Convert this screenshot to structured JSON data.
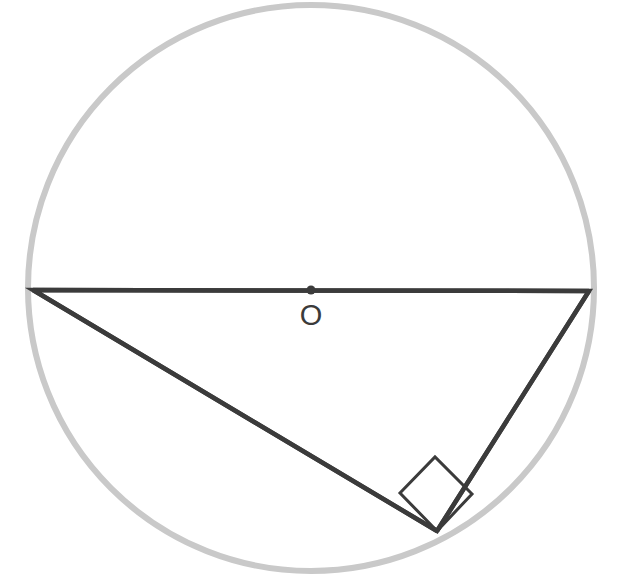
{
  "figure": {
    "kind": "circle-geometry-diagram",
    "canvas": {
      "width": 623,
      "height": 588,
      "background": "#ffffff"
    },
    "circle": {
      "name": "circumscribed-circle",
      "center_x": 311,
      "center_y": 288,
      "radius": 283,
      "stroke": "#c9c9c9",
      "stroke_width": 6,
      "fill": "none"
    },
    "center_point": {
      "name": "center-point-o",
      "x": 311,
      "y": 290,
      "radius": 4.5,
      "color": "#3b3b3b"
    },
    "center_label": {
      "text": "O",
      "x": 311,
      "y": 315,
      "color": "#3b3b3b",
      "font_size": 29
    },
    "triangle": {
      "name": "inscribed-right-triangle",
      "stroke": "#3b3b3b",
      "stroke_width": 4.5,
      "fill": "none",
      "vertices": [
        {
          "label": "left-vertex",
          "x": 33,
          "y": 290
        },
        {
          "label": "right-vertex",
          "x": 589,
          "y": 291
        },
        {
          "label": "bottom-vertex",
          "x": 437,
          "y": 531
        }
      ],
      "sides": [
        {
          "name": "diameter-hypotenuse",
          "from": "left-vertex",
          "to": "right-vertex"
        },
        {
          "name": "long-leg",
          "from": "left-vertex",
          "to": "bottom-vertex"
        },
        {
          "name": "short-leg",
          "from": "right-vertex",
          "to": "bottom-vertex"
        }
      ]
    },
    "right_angle_marker": {
      "name": "right-angle-square",
      "at_vertex": "bottom-vertex",
      "size": 52,
      "stroke": "#3b3b3b",
      "stroke_width": 3,
      "fill": "none",
      "points": "437,531 400,493 435,457 472,494"
    }
  }
}
